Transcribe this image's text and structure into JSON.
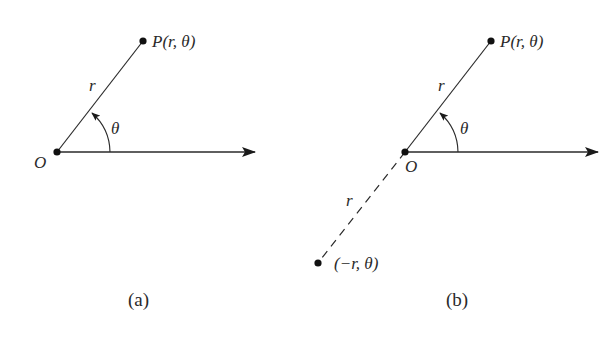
{
  "figure": {
    "background": "#ffffff",
    "ink_color": "#2a2a2a",
    "panels": [
      {
        "id": "a",
        "caption": "(a)",
        "origin_label": "O",
        "point_label_prefix": "P",
        "point_label_args": "(r, θ)",
        "radius_label": "r",
        "angle_label": "θ",
        "description": "Point P(r, θ) at distance r from pole O, angle θ measured counterclockwise from polar axis"
      },
      {
        "id": "b",
        "caption": "(b)",
        "origin_label": "O",
        "point_label_prefix": "P",
        "point_label_args": "(r, θ)",
        "radius_label": "r",
        "angle_label": "θ",
        "negative_radius_label": "r",
        "negative_point_label": "(−r, θ)",
        "description": "Point (−r, θ) lies on the ray opposite to θ, at distance r from O (dashed segment)"
      }
    ]
  }
}
